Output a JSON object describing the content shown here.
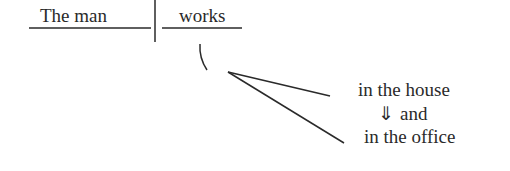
{
  "diagram": {
    "type": "sentence-diagram",
    "subject": "The man",
    "verb": "works",
    "modifiers": {
      "first": "in the house",
      "conjunction_arrow": "⇓",
      "conjunction": "and",
      "second": "in the office"
    }
  },
  "colors": {
    "ink": "#2a2a2a",
    "background": "#ffffff"
  }
}
